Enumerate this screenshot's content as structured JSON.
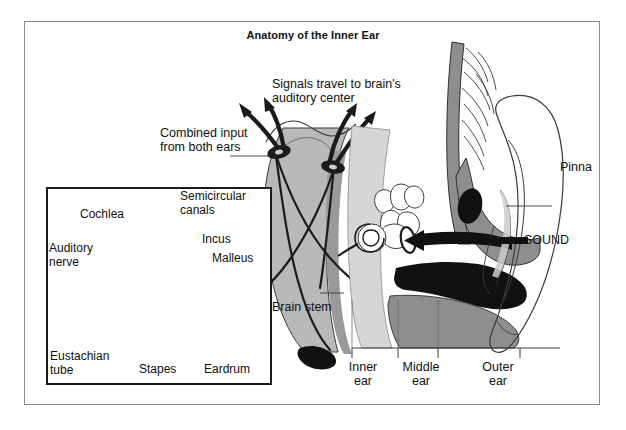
{
  "figure": {
    "title": "Anatomy of the Inner Ear",
    "domain": "anatomical-illustration",
    "frame": {
      "border_color": "#8a8a8a",
      "background": "#ffffff"
    }
  },
  "palette": {
    "ink": "#1b1b1b",
    "text": "#111111",
    "tissue_gray": "#b9b9b9",
    "tissue_gray_dark": "#8e8e8e",
    "tissue_gray_light": "#d6d6d6",
    "black_fill": "#111111",
    "white_fill": "#ffffff",
    "frame_gray": "#8a8a8a"
  },
  "main_labels": {
    "signals": "Signals travel to brain's\nauditory center",
    "combined_input": "Combined input\nfrom both ears",
    "brain_stem": "Brain stem",
    "pinna": "Pinna",
    "sound": "SOUND"
  },
  "region_labels": [
    {
      "id": "inner-ear",
      "text": "Inner\near"
    },
    {
      "id": "middle-ear",
      "text": "Middle\near"
    },
    {
      "id": "outer-ear",
      "text": "Outer\near"
    }
  ],
  "inset": {
    "labels": [
      {
        "id": "cochlea",
        "text": "Cochlea"
      },
      {
        "id": "semicircular-canals",
        "text": "Semicircular\ncanals"
      },
      {
        "id": "auditory-nerve",
        "text": "Auditory\nnerve"
      },
      {
        "id": "incus",
        "text": "Incus"
      },
      {
        "id": "malleus",
        "text": "Malleus"
      },
      {
        "id": "eustachian-tube",
        "text": "Eustachian\ntube"
      },
      {
        "id": "stapes",
        "text": "Stapes"
      },
      {
        "id": "eardrum",
        "text": "Eardrum"
      }
    ]
  },
  "icons": {
    "sound_arrow": "left-arrow-icon",
    "signal_arrows": "upward-arrows-icon"
  }
}
